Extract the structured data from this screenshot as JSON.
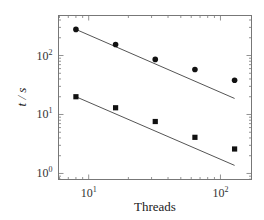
{
  "chart_data": {
    "type": "scatter",
    "title": "",
    "xlabel": "Threads",
    "ylabel": "t / s",
    "xscale": "log",
    "yscale": "log",
    "xlim": [
      5.9,
      172
    ],
    "ylim": [
      0.79,
      477
    ],
    "x_ticks": [
      {
        "value": 10,
        "label": "10",
        "exp": "1"
      },
      {
        "value": 100,
        "label": "10",
        "exp": "2"
      }
    ],
    "y_ticks": [
      {
        "value": 1,
        "label": "10",
        "exp": "0"
      },
      {
        "value": 10,
        "label": "10",
        "exp": "1"
      },
      {
        "value": 100,
        "label": "10",
        "exp": "2"
      }
    ],
    "grid": false,
    "legend": null,
    "x": [
      8,
      16,
      32,
      64,
      128
    ],
    "series": [
      {
        "name": "circles",
        "marker": "circle",
        "values": [
          277,
          154,
          86,
          58,
          38
        ],
        "fit_line": {
          "x": [
            8,
            128
          ],
          "y": [
            277,
            18.7
          ]
        }
      },
      {
        "name": "squares",
        "marker": "square",
        "values": [
          20,
          13,
          7.6,
          4.1,
          2.6
        ],
        "fit_line": {
          "x": [
            8,
            128
          ],
          "y": [
            20,
            1.37
          ]
        }
      }
    ],
    "colors": {
      "markers": "#111111",
      "lines": "#555555",
      "frame": "#777777"
    }
  }
}
